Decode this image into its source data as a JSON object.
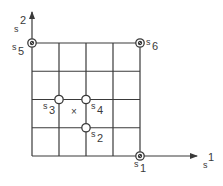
{
  "diagram": {
    "type": "grid-lattice",
    "grid": {
      "cols": 4,
      "rows": 4
    },
    "axes": {
      "x": {
        "label_base": "s",
        "label_sup": "1"
      },
      "y": {
        "label_base": "s",
        "label_sup": "2"
      }
    },
    "points": [
      {
        "id": "s1",
        "label_base": "s",
        "label_sub": "1",
        "grid": [
          4,
          0
        ],
        "style": "filled-target",
        "label_pos": "below"
      },
      {
        "id": "s2",
        "label_base": "s",
        "label_sub": "2",
        "grid": [
          2,
          1
        ],
        "style": "open",
        "label_pos": "below-right"
      },
      {
        "id": "s3",
        "label_base": "s",
        "label_sub": "3",
        "grid": [
          1,
          2
        ],
        "style": "open",
        "label_pos": "below-left"
      },
      {
        "id": "s4",
        "label_base": "s",
        "label_sub": "4",
        "grid": [
          2,
          2
        ],
        "style": "open",
        "label_pos": "below-right"
      },
      {
        "id": "s5",
        "label_base": "s",
        "label_sub": "5",
        "grid": [
          0,
          4
        ],
        "style": "filled-target",
        "label_pos": "left"
      },
      {
        "id": "s6",
        "label_base": "s",
        "label_sub": "6",
        "grid": [
          4,
          4
        ],
        "style": "filled-target",
        "label_pos": "right"
      }
    ],
    "marker": {
      "symbol": "×",
      "grid": [
        1.55,
        1.55
      ]
    },
    "colors": {
      "line": "#3a3a3a",
      "background": "#ffffff"
    }
  }
}
